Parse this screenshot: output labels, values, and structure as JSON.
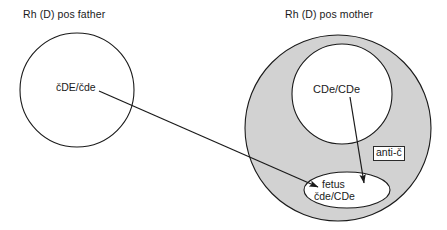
{
  "figure": {
    "type": "genetics-pedigree-diagram",
    "background_color": "#ffffff",
    "shaded_fill_color": "#d2d2d2",
    "stroke_color": "#1a1a1a",
    "text_color": "#1a1a1a"
  },
  "father": {
    "title": "Rh (D) pos father",
    "genotype": "čDE/čde",
    "circle": {
      "cx": 77,
      "cy": 90,
      "r": 57,
      "fill": "none"
    }
  },
  "mother": {
    "title": "Rh (D) pos mother",
    "genotype": "CDe/CDe",
    "outer_circle": {
      "cx": 338,
      "cy": 128,
      "r": 93,
      "fill": "#d2d2d2"
    },
    "inner_circle": {
      "cx": 342,
      "cy": 94,
      "r": 50,
      "fill": "#ffffff"
    },
    "antibody_label": "anti-č"
  },
  "fetus": {
    "label_line_1": "fetus",
    "label_line_2": "čde/CDe",
    "ellipse": {
      "cx": 347,
      "cy": 190,
      "rx": 43,
      "ry": 18,
      "fill": "#ffffff"
    }
  },
  "arrows": [
    {
      "name": "paternal-allele-arrow",
      "from_label": "čDE/čde",
      "to_label": "fetus",
      "x1": 99,
      "y1": 91,
      "x2": 318,
      "y2": 187
    },
    {
      "name": "maternal-antibody-arrow",
      "from_label": "CDe/CDe",
      "to_label": "fetus",
      "x1": 350,
      "y1": 97,
      "x2": 364,
      "y2": 183
    }
  ]
}
